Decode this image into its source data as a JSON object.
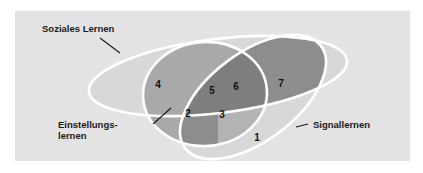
{
  "figure": {
    "type": "venn-diagram",
    "set_count": 3,
    "background_color": "#e3e3e3",
    "panel_border_color": "#ffffff",
    "outline_color": "#ffffff"
  },
  "sets": [
    {
      "id": "soziales-lernen",
      "label": "Soziales Lernen",
      "label_x": 42,
      "label_y": 32,
      "leader": {
        "x1": 100,
        "y1": 38,
        "x2": 120,
        "y2": 53
      }
    },
    {
      "id": "einstellungslernen",
      "label_line1": "Einstellungs-",
      "label_line2": "lernen",
      "label_x": 58,
      "label_y": 128,
      "leader": {
        "x1": 153,
        "y1": 124,
        "x2": 171,
        "y2": 108
      }
    },
    {
      "id": "signallernen",
      "label": "Signallernen",
      "label_x": 313,
      "label_y": 128,
      "leader": {
        "x1": 296,
        "y1": 127,
        "x2": 308,
        "y2": 124
      }
    }
  ],
  "regions": [
    {
      "id": "region-1",
      "number": "1",
      "x": 257,
      "y": 141,
      "shade": "light",
      "color": "#d8d8d8",
      "belongs_to": "signallernen-only"
    },
    {
      "id": "region-2",
      "number": "2",
      "x": 188,
      "y": 117,
      "shade": "dark",
      "color": "#8d8d8d",
      "belongs_to": "einstellungslernen-and-signallernen"
    },
    {
      "id": "region-3",
      "number": "3",
      "x": 222,
      "y": 118,
      "shade": "medium",
      "color": "#b3b3b3",
      "belongs_to": "einstellungslernen-and-signallernen-lower"
    },
    {
      "id": "region-4",
      "number": "4",
      "x": 158,
      "y": 88,
      "shade": "light",
      "color": "#d8d8d8",
      "belongs_to": "soziales-lernen-only"
    },
    {
      "id": "region-5",
      "number": "5",
      "x": 212,
      "y": 94,
      "shade": "medium",
      "color": "#a9a9a9",
      "belongs_to": "soziales-lernen-and-einstellungslernen"
    },
    {
      "id": "region-6",
      "number": "6",
      "x": 236,
      "y": 90,
      "shade": "darkest",
      "color": "#7e7e7e",
      "belongs_to": "all-three-sets"
    },
    {
      "id": "region-7",
      "number": "7",
      "x": 281,
      "y": 87,
      "shade": "dark",
      "color": "#8d8d8d",
      "belongs_to": "soziales-lernen-and-signallernen"
    }
  ],
  "colors": {
    "background": "#e3e3e3",
    "outline": "#ffffff",
    "light": "#d8d8d8",
    "medium": "#b3b3b3",
    "medium_dark": "#a9a9a9",
    "dark": "#8d8d8d",
    "darkest": "#7e7e7e",
    "text": "#111111"
  }
}
